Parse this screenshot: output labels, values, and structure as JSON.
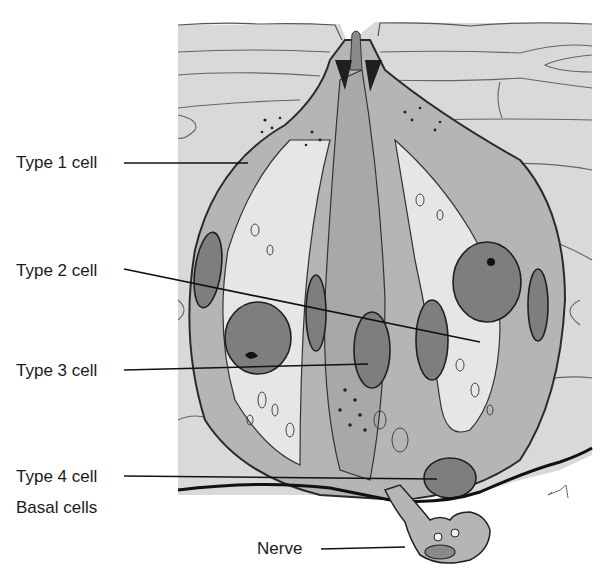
{
  "diagram": {
    "labels": [
      {
        "id": "type1",
        "text": "Type 1 cell",
        "x": 16,
        "y": 154
      },
      {
        "id": "type2",
        "text": "Type 2 cell",
        "x": 16,
        "y": 262
      },
      {
        "id": "type3",
        "text": "Type 3 cell",
        "x": 16,
        "y": 362
      },
      {
        "id": "type4",
        "text": "Type 4 cell",
        "x": 16,
        "y": 468
      },
      {
        "id": "basal",
        "text": "Basal cells",
        "x": 16,
        "y": 499
      },
      {
        "id": "nerve",
        "text": "Nerve",
        "x": 257,
        "y": 544
      }
    ],
    "leaders": [
      {
        "id": "type1",
        "x1": 124,
        "y1": 163,
        "x2": 248,
        "y2": 163
      },
      {
        "id": "type2",
        "x1": 124,
        "y1": 269,
        "x2": 480,
        "y2": 342
      },
      {
        "id": "type3",
        "x1": 124,
        "y1": 370,
        "x2": 368,
        "y2": 364
      },
      {
        "id": "type4",
        "x1": 124,
        "y1": 476,
        "x2": 437,
        "y2": 479
      },
      {
        "id": "nerve",
        "x1": 321,
        "y1": 549,
        "x2": 405,
        "y2": 547
      }
    ],
    "colors": {
      "background": "#ffffff",
      "epithelium": "#d9d9d9",
      "cell_dark": "#9a9a9a",
      "cell_mid": "#b5b5b5",
      "cell_light": "#e6e6e6",
      "nucleus": "#7e7e7e",
      "outline": "#2a2a2a",
      "leader": "#111111"
    }
  }
}
